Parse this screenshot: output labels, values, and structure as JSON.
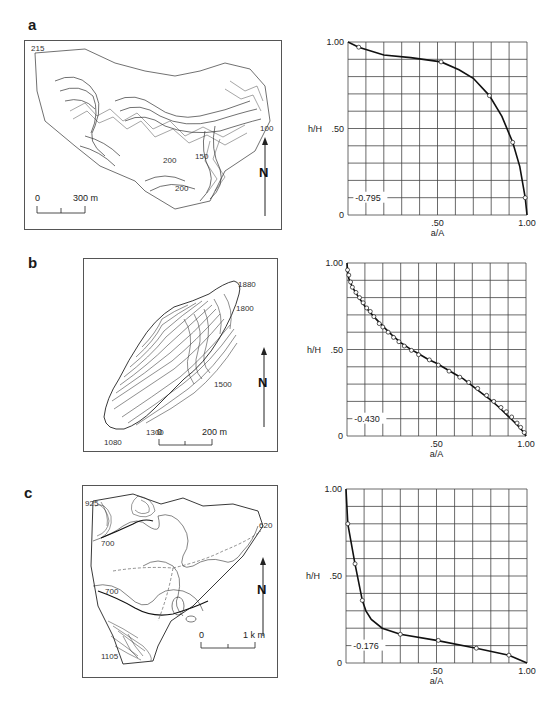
{
  "figure": {
    "panels": [
      {
        "label": "a",
        "map": {
          "contour_labels": [
            "215",
            "200",
            "150",
            "100",
            "200"
          ],
          "north_label": "N",
          "scale_start": "0",
          "scale_end": "300 m"
        },
        "chart": {
          "ylabel": "h/H",
          "xlabel": "a/A",
          "y_ticks": [
            "1.00",
            ".50",
            "0"
          ],
          "x_ticks": [
            ".50",
            "1.00"
          ],
          "integral_label": "0.795"
        }
      },
      {
        "label": "b",
        "map": {
          "contour_labels": [
            "1880",
            "1800",
            "1500",
            "1300",
            "1080"
          ],
          "north_label": "N",
          "scale_start": "0",
          "scale_end": "200 m"
        },
        "chart": {
          "ylabel": "h/H",
          "xlabel": "a/A",
          "y_ticks": [
            "1.00",
            ".50",
            "0"
          ],
          "x_ticks": [
            ".50",
            "1.00"
          ],
          "integral_label": "0.430"
        }
      },
      {
        "label": "c",
        "map": {
          "contour_labels": [
            "925",
            "700",
            "700",
            "620",
            "1105"
          ],
          "north_label": "N",
          "scale_start": "0",
          "scale_end": "1 k m"
        },
        "chart": {
          "ylabel": "h/H",
          "xlabel": "a/A",
          "y_ticks": [
            "1.00",
            ".50",
            "0"
          ],
          "x_ticks": [
            ".50",
            "1.00"
          ],
          "integral_label": "0.176"
        }
      }
    ]
  },
  "chart_data": [
    {
      "type": "line",
      "title": "a",
      "xlabel": "a/A",
      "ylabel": "h/H",
      "xlim": [
        0,
        1
      ],
      "ylim": [
        0,
        1
      ],
      "grid": true,
      "grid_divisions": 10,
      "annotation": "0.795",
      "annotation_y": 0.1,
      "curve": {
        "x": [
          0,
          0.06,
          0.2,
          0.35,
          0.52,
          0.62,
          0.7,
          0.79,
          0.86,
          0.92,
          0.96,
          0.99,
          1.0
        ],
        "y": [
          1.0,
          0.97,
          0.925,
          0.91,
          0.885,
          0.84,
          0.79,
          0.69,
          0.57,
          0.42,
          0.28,
          0.1,
          0.0
        ]
      },
      "markers": {
        "x": [
          0.06,
          0.52,
          0.79,
          0.92,
          0.99
        ],
        "y": [
          0.97,
          0.885,
          0.69,
          0.42,
          0.1
        ]
      }
    },
    {
      "type": "line",
      "title": "b",
      "xlabel": "a/A",
      "ylabel": "h/H",
      "xlim": [
        0,
        1
      ],
      "ylim": [
        0,
        1
      ],
      "grid": true,
      "grid_divisions": 10,
      "annotation": "0.430",
      "annotation_y": 0.1,
      "curve": {
        "x": [
          0,
          0.003,
          0.01,
          0.03,
          0.06,
          0.1,
          0.15,
          0.2,
          0.25,
          0.3,
          0.35,
          0.4,
          0.45,
          0.5,
          0.55,
          0.6,
          0.65,
          0.7,
          0.75,
          0.8,
          0.85,
          0.9,
          0.95,
          0.98,
          1.0
        ],
        "y": [
          1.0,
          0.96,
          0.91,
          0.86,
          0.81,
          0.75,
          0.69,
          0.635,
          0.585,
          0.54,
          0.505,
          0.475,
          0.445,
          0.42,
          0.39,
          0.36,
          0.33,
          0.29,
          0.25,
          0.21,
          0.165,
          0.115,
          0.065,
          0.03,
          0.0
        ]
      },
      "markers": {
        "x": [
          0.003,
          0.01,
          0.02,
          0.03,
          0.05,
          0.07,
          0.09,
          0.11,
          0.13,
          0.15,
          0.18,
          0.2,
          0.23,
          0.26,
          0.29,
          0.32,
          0.36,
          0.4,
          0.46,
          0.51,
          0.57,
          0.63,
          0.68,
          0.73,
          0.78,
          0.82,
          0.86,
          0.89,
          0.92,
          0.95,
          0.97,
          0.99
        ],
        "y": [
          0.96,
          0.93,
          0.89,
          0.86,
          0.83,
          0.8,
          0.77,
          0.74,
          0.72,
          0.69,
          0.65,
          0.63,
          0.6,
          0.57,
          0.545,
          0.52,
          0.495,
          0.47,
          0.44,
          0.41,
          0.375,
          0.34,
          0.31,
          0.275,
          0.235,
          0.2,
          0.165,
          0.14,
          0.11,
          0.075,
          0.05,
          0.02
        ]
      }
    },
    {
      "type": "line",
      "title": "c",
      "xlabel": "a/A",
      "ylabel": "h/H",
      "xlim": [
        0,
        1
      ],
      "ylim": [
        0,
        1
      ],
      "grid": true,
      "grid_divisions": 10,
      "annotation": "0.176",
      "annotation_y": 0.1,
      "curve": {
        "x": [
          0,
          0.01,
          0.05,
          0.09,
          0.11,
          0.14,
          0.2,
          0.3,
          0.5,
          0.72,
          0.9,
          1.0
        ],
        "y": [
          1.0,
          0.8,
          0.57,
          0.36,
          0.3,
          0.25,
          0.2,
          0.165,
          0.13,
          0.085,
          0.045,
          0.0
        ]
      },
      "markers": {
        "x": [
          0.01,
          0.05,
          0.09,
          0.3,
          0.51,
          0.72,
          0.9
        ],
        "y": [
          0.8,
          0.57,
          0.36,
          0.165,
          0.13,
          0.085,
          0.045
        ]
      }
    }
  ]
}
